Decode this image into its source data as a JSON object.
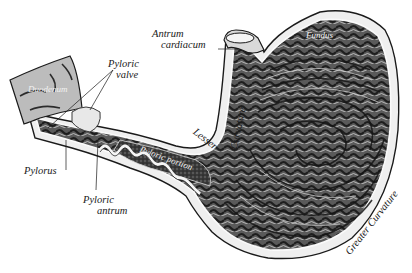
{
  "figure": {
    "colors": {
      "background": "#ffffff",
      "ink": "#1a1a1a",
      "mucosa_dark": "#2b2b2b",
      "mucosa_mid": "#6e6e6e",
      "mucosa_light": "#bdbdbd",
      "wall": "#e6e6e6"
    },
    "labels": {
      "antrum_cardiacum_line1": "Antrum",
      "antrum_cardiacum_line2": "cardiacum",
      "fundus": "Fundus",
      "duodenum": "Duodenum",
      "pyloric_valve_line1": "Pyloric",
      "pyloric_valve_line2": "valve",
      "lesser": "Lesser",
      "curvature_lesser": "Curvature",
      "pyloric_portion": "Pyloric portion",
      "pylorus": "Pylorus",
      "pyloric_antrum_line1": "Pyloric",
      "pyloric_antrum_line2": "antrum",
      "greater_curvature": "Greater Curvature"
    }
  }
}
